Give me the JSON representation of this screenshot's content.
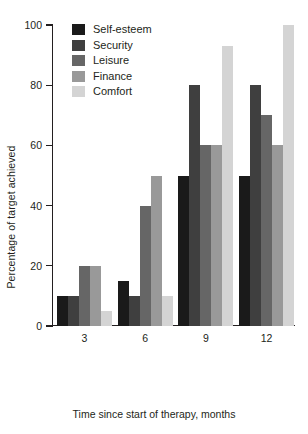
{
  "chart_data": {
    "type": "bar",
    "title": "",
    "xlabel": "Time since start of therapy, months",
    "ylabel": "Percentage of target achieved",
    "categories": [
      "3",
      "6",
      "9",
      "12"
    ],
    "ylim": [
      0,
      100
    ],
    "yticks": [
      0,
      20,
      40,
      60,
      80,
      100
    ],
    "ytick_labels": [
      "0",
      "20",
      "40",
      "60",
      "80",
      "100"
    ],
    "grid": false,
    "legend_position": "top-left-inside",
    "series": [
      {
        "name": "Self-esteem",
        "color": "#1a1a1a",
        "values": [
          10,
          15,
          50,
          50
        ]
      },
      {
        "name": "Security",
        "color": "#3f3f3f",
        "values": [
          10,
          10,
          80,
          80
        ]
      },
      {
        "name": "Leisure",
        "color": "#666666",
        "values": [
          20,
          40,
          60,
          70
        ]
      },
      {
        "name": "Finance",
        "color": "#999999",
        "values": [
          20,
          50,
          60,
          60
        ]
      },
      {
        "name": "Comfort",
        "color": "#d4d4d4",
        "values": [
          5,
          10,
          93,
          100
        ]
      }
    ]
  }
}
